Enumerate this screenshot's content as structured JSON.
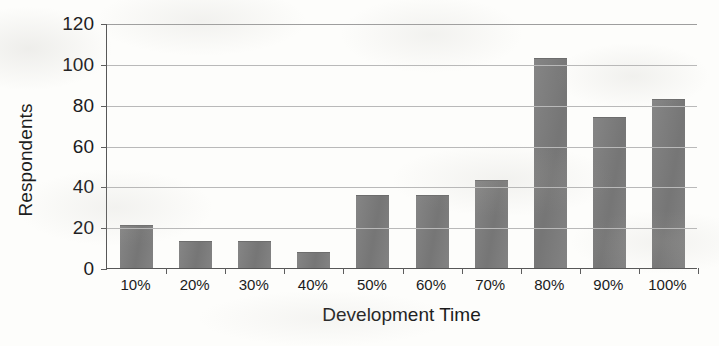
{
  "chart_data": {
    "type": "bar",
    "title": "",
    "xlabel": "Development Time",
    "ylabel": "Respondents",
    "categories": [
      "10%",
      "20%",
      "30%",
      "40%",
      "50%",
      "60%",
      "70%",
      "80%",
      "90%",
      "100%"
    ],
    "values": [
      21,
      13,
      13,
      8,
      36,
      36,
      43,
      103,
      74,
      83
    ],
    "ylim": [
      0,
      120
    ],
    "ytick_labels": [
      "0",
      "20",
      "40",
      "60",
      "80",
      "100",
      "120"
    ],
    "ytick_values": [
      0,
      20,
      40,
      60,
      80,
      100,
      120
    ],
    "grid": "horizontal",
    "legend": "none",
    "bar_color": "#7c7c7c",
    "gridline_color": "#b9b9b9",
    "axis_color": "#575757",
    "background_color": "#fdfdfb"
  }
}
